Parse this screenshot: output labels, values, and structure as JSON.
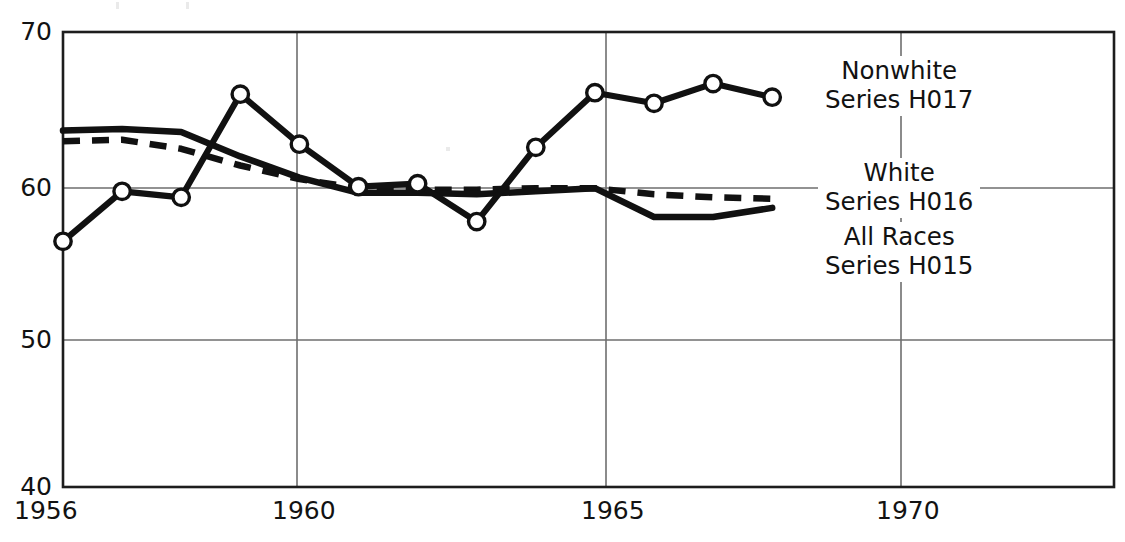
{
  "chart_data": {
    "type": "line",
    "title": "",
    "subtitle": "",
    "xlabel": "",
    "ylabel": "",
    "xlim": [
      1956,
      1971.6
    ],
    "ylim": [
      40,
      70
    ],
    "grid": true,
    "x_ticks": [
      1956,
      1960,
      1965,
      1970
    ],
    "x_tick_labels": [
      "1956",
      "1960",
      "1965",
      "1970"
    ],
    "y_ticks": [
      40,
      50,
      60,
      70
    ],
    "y_tick_labels": [
      "40",
      "50",
      "60",
      "70"
    ],
    "legend_position": "inside-right",
    "x": [
      1956,
      1957,
      1958,
      1959,
      1960,
      1961,
      1962,
      1963,
      1964,
      1965,
      1966,
      1967,
      1968
    ],
    "series": [
      {
        "name": "Nonwhite",
        "series_id": "Series H017",
        "style": "solid-with-markers",
        "marker": "open-circle",
        "color": "#111111",
        "values": [
          56.2,
          59.5,
          59.1,
          65.9,
          62.6,
          59.8,
          60.0,
          57.5,
          62.4,
          66.0,
          65.3,
          66.6,
          65.7
        ]
      },
      {
        "name": "White",
        "series_id": "Series H016",
        "style": "dashed",
        "marker": "none",
        "color": "#111111",
        "values": [
          62.8,
          62.9,
          62.3,
          61.2,
          60.3,
          59.7,
          59.6,
          59.6,
          59.7,
          59.7,
          59.3,
          59.1,
          59.0
        ]
      },
      {
        "name": "All Races",
        "series_id": "Series H015",
        "style": "solid",
        "marker": "none",
        "color": "#111111",
        "values": [
          63.5,
          63.6,
          63.4,
          61.8,
          60.4,
          59.4,
          59.4,
          59.3,
          59.5,
          59.7,
          57.8,
          57.8,
          58.4
        ]
      }
    ],
    "legend_entries": [
      {
        "name": "Nonwhite",
        "series_id": "Series H017"
      },
      {
        "name": "White",
        "series_id": "Series H016"
      },
      {
        "name": "All Races",
        "series_id": "Series H015"
      }
    ]
  },
  "axes": {
    "y_tick_70": "70",
    "y_tick_60": "60",
    "y_tick_50": "50",
    "y_tick_40": "40",
    "x_tick_1956": "1956",
    "x_tick_1960": "1960",
    "x_tick_1965": "1965",
    "x_tick_1970": "1970"
  },
  "legend": {
    "nonwhite_name": "Nonwhite",
    "nonwhite_series": "Series H017",
    "white_name": "White",
    "white_series": "Series H016",
    "allraces_name": "All Races",
    "allraces_series": "Series H015"
  }
}
